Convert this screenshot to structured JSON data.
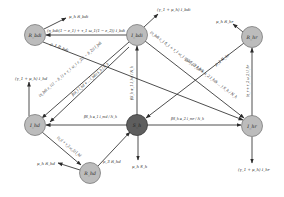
{
  "diagram": {
    "type": "compartmental-flow-diagram",
    "nodes": {
      "R_bdi": {
        "label": "R_bdi",
        "x": 35,
        "y": 35,
        "shade": "light"
      },
      "I_bdi": {
        "label": "I_bdi",
        "x": 137,
        "y": 35,
        "shade": "light"
      },
      "R_hr": {
        "label": "R_hr",
        "x": 252,
        "y": 37,
        "shade": "light"
      },
      "I_hd": {
        "label": "I_hd",
        "x": 35,
        "y": 125,
        "shade": "light"
      },
      "S_h": {
        "label": "S_h",
        "x": 137,
        "y": 125,
        "shade": "dark"
      },
      "I_hr": {
        "label": "I_hr",
        "x": 252,
        "y": 126,
        "shade": "light"
      },
      "R_hd": {
        "label": "R_hd",
        "x": 90,
        "y": 173,
        "shade": "light"
      }
    },
    "edge_labels": {
      "rbdi_out": "μ_h R_bdi",
      "ibdi_to_rbdi": "(η_bdi(1 − ε_1) + τ_1 ω_1(1 − ε_2)) I_bdi",
      "ibdi_out": "(γ_1 + μ_h) I_bdi",
      "rbdi_to_sh": "ρ_1 R_bdi",
      "ibdi_to_ihd": "(η_bdi ε_1(1 − δ_1) + τ_1 ω_1 ε_2(1 − δ_2)) I_bdi",
      "sh_to_ibdi_left": "β(α_1 I_hd + ... I_bdi) S_h / N_h",
      "ibdi_to_ihr": "(η_bdi ε_1 δ_1 + τ_1 ω_1 ε_2 δ_2) I_bdi",
      "rhr_to_sh": "ρ_2 R_hr",
      "sh_to_ibdi_vert": "βS_h α_1 I_hd / N_h",
      "sh_to_ibdi_diag": "β(α_1 I_hd + α_2 I_hdi ... ) S_h / N_h",
      "rhr_out": "μ_h R_hr",
      "ihr_to_rhr": "(η_r + τ_2 ω_2) I_hr",
      "ihd_out": "(γ_1 + μ_h) I_hd",
      "sh_to_ihd": "βS_h α_1 I_md / N_h",
      "sh_to_ihr": "βS_h α_2 I_mr / N_h",
      "ihd_to_rhd": "(η_d + τ_3 ω_3) I_hd",
      "rhd_out": "μ_h R_hd",
      "rhd_to_sh": "ρ_3 R_hd",
      "sh_out": "μ_h S_h",
      "ihr_out": "(γ_1 + μ_h) I_hr"
    },
    "colors": {
      "node_light": "#bcbcbc",
      "node_dark": "#5e5e5e",
      "edge": "#3a3a3a"
    }
  }
}
